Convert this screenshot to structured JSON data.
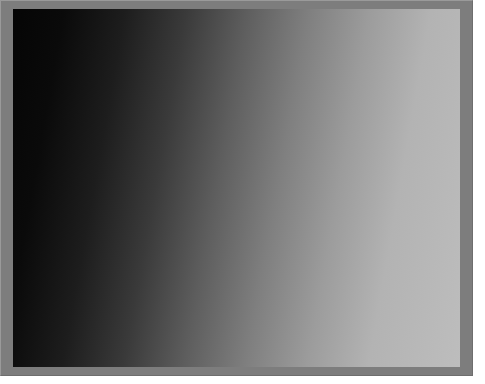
{
  "image": {
    "kind": "planetary-surface-photograph",
    "subject": "heavily cratered planetary surface near the day-night terminator",
    "palette": "grayscale",
    "frame": {
      "mount_color": "#7d7d7d",
      "bevel_light": "#9a9a9a",
      "bevel_dark": "#6e6e6e",
      "page_background": "#ffffff",
      "mount_width_px": 473,
      "mount_height_px": 376,
      "plate_left_px": 13,
      "plate_top_px": 9,
      "plate_width_px": 447,
      "plate_height_px": 358
    },
    "tones": {
      "deep_shadow": "#040404",
      "shadow": "#1e1e1e",
      "midtone_dark": "#4a4a4a",
      "midtone": "#777777",
      "midtone_light": "#9e9e9e",
      "highlight": "#c8c8c8",
      "specular": "#e8e8e8"
    },
    "illumination": {
      "description": "low sun angle from the right, terminator darkness at upper-left",
      "sun_azimuth_deg": 95,
      "terminator_axis_deg": 118,
      "bright_limb_side": "right"
    },
    "regions": [
      {
        "name": "terminator-darkness",
        "description": "near-black unlit highlands occupying the upper-left corner",
        "center": [
          0.08,
          0.12
        ],
        "radius": 0.42,
        "base_tone": 0.03
      },
      {
        "name": "shadowed-highlands",
        "description": "rugged partially lit cratered highlands on the left half",
        "center": [
          0.24,
          0.48
        ],
        "radius": 0.45,
        "base_tone": 0.3
      },
      {
        "name": "central-basin-ejecta",
        "description": "mid-gray rubbly terrain surrounding the large central crater",
        "center": [
          0.47,
          0.52
        ],
        "radius": 0.36,
        "base_tone": 0.5
      },
      {
        "name": "bright-plains",
        "description": "brightly illuminated smooth cratered plains along the right edge",
        "center": [
          0.85,
          0.35
        ],
        "radius": 0.46,
        "base_tone": 0.74
      },
      {
        "name": "southern-plains",
        "description": "moderately lit plains across the lower-right quadrant",
        "center": [
          0.78,
          0.82
        ],
        "radius": 0.38,
        "base_tone": 0.64
      }
    ],
    "features": {
      "central_crater": {
        "name": "large-central-crater",
        "description": "prominent ~100px crater with raised bright rim and smooth dark interior floor",
        "center_x": 0.44,
        "center_y": 0.4,
        "radius_x": 0.165,
        "radius_y": 0.135,
        "rotation_deg": -14,
        "rim_highlight": 0.93,
        "floor_tone": 0.41,
        "interior_shadow_tone": 0.06,
        "shadow_side_deg": 205
      },
      "scarp_shadow": {
        "name": "diagonal-scarp-shadow",
        "description": "strong black shadow band cast by a scarp running from upper-centre down to the lower-centre",
        "points": [
          [
            0.6,
            0.13
          ],
          [
            0.635,
            0.22
          ],
          [
            0.645,
            0.31
          ],
          [
            0.625,
            0.4
          ],
          [
            0.6,
            0.49
          ],
          [
            0.605,
            0.58
          ],
          [
            0.645,
            0.66
          ],
          [
            0.67,
            0.74
          ],
          [
            0.66,
            0.83
          ],
          [
            0.63,
            0.92
          ],
          [
            0.605,
            0.99
          ]
        ],
        "width": 0.045,
        "tone": 0.015
      },
      "named_craters": [
        {
          "name": "rimmed-crater-lower-left",
          "cx": 0.095,
          "cy": 0.835,
          "r": 0.062,
          "shadow_deg": 25,
          "rim": 0.85,
          "floor": 0.2
        },
        {
          "name": "shadow-filled-crater-lower-left",
          "cx": 0.205,
          "cy": 0.735,
          "r": 0.05,
          "shadow_deg": 20,
          "rim": 0.8,
          "floor": 0.12
        },
        {
          "name": "bright-rim-crater-mid-left",
          "cx": 0.145,
          "cy": 0.62,
          "r": 0.036,
          "shadow_deg": 15,
          "rim": 0.88,
          "floor": 0.18
        },
        {
          "name": "twin-crater-left",
          "cx": 0.06,
          "cy": 0.56,
          "r": 0.03,
          "shadow_deg": 10,
          "rim": 0.72,
          "floor": 0.14
        },
        {
          "name": "oval-crater-bottom-centre",
          "cx": 0.34,
          "cy": 0.945,
          "r": 0.048,
          "shadow_deg": 30,
          "rim": 0.86,
          "floor": 0.22
        },
        {
          "name": "terraced-crater-right",
          "cx": 0.91,
          "cy": 0.79,
          "r": 0.056,
          "shadow_deg": 200,
          "rim": 0.9,
          "floor": 0.56
        },
        {
          "name": "small-bright-crater-upper-right",
          "cx": 0.79,
          "cy": 0.115,
          "r": 0.028,
          "shadow_deg": 210,
          "rim": 0.96,
          "floor": 0.6
        },
        {
          "name": "dark-floor-crater-right",
          "cx": 0.7,
          "cy": 0.65,
          "r": 0.034,
          "shadow_deg": 195,
          "rim": 0.82,
          "floor": 0.3
        },
        {
          "name": "chain-crater-centre",
          "cx": 0.47,
          "cy": 0.79,
          "r": 0.04,
          "shadow_deg": 25,
          "rim": 0.78,
          "floor": 0.24
        },
        {
          "name": "ridge-crater-centre-left",
          "cx": 0.3,
          "cy": 0.56,
          "r": 0.032,
          "shadow_deg": 18,
          "rim": 0.76,
          "floor": 0.2
        }
      ],
      "crater_field": {
        "description": "procedurally scattered small impact craters covering the whole frame",
        "count": 540,
        "min_radius": 0.004,
        "max_radius": 0.03,
        "seed": 20240617
      },
      "roughness": {
        "description": "fine-grained regolith texture and boulder speckle",
        "grain_amplitude": 0.085,
        "speckle_amplitude": 0.16,
        "octaves": 5
      }
    }
  }
}
